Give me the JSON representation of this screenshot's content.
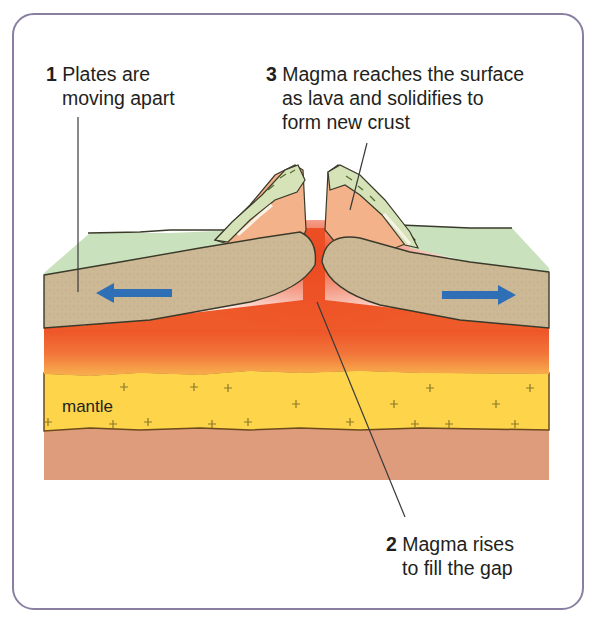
{
  "labels": [
    {
      "number": "1",
      "lines": [
        "Plates are",
        "moving apart"
      ]
    },
    {
      "number": "2",
      "lines": [
        "Magma rises",
        "to fill the gap"
      ]
    },
    {
      "number": "3",
      "lines": [
        "Magma reaches the surface",
        "as lava and solidifies to",
        "form new crust"
      ]
    }
  ],
  "layers": {
    "mantle_label": "mantle"
  },
  "arrows": [
    {
      "direction": "left",
      "meaning": "plate movement"
    },
    {
      "direction": "right",
      "meaning": "plate movement"
    }
  ],
  "colors": {
    "frame_border": "#8a7fa0",
    "crust_surface": "#c9e2bd",
    "plate": "#cdb895",
    "magma": "#ef5a2a",
    "magma_light": "#f6a04a",
    "mantle": "#fdd44a",
    "lower_layer": "#df9a79",
    "new_crust": "#f3b28a",
    "arrow": "#2f6fb5"
  }
}
